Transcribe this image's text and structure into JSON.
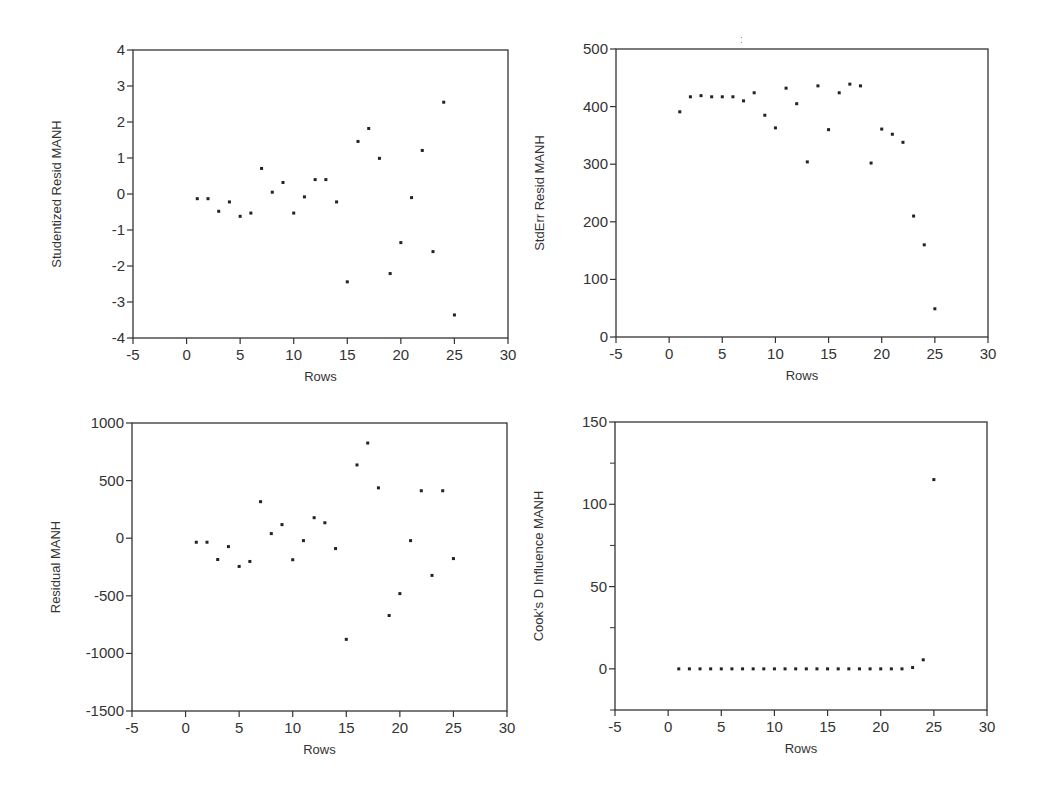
{
  "chart_data": [
    {
      "type": "scatter",
      "title": "",
      "xlabel": "Rows",
      "ylabel": "Studentized Resid MANH",
      "xlim": [
        -5,
        30
      ],
      "ylim": [
        -4,
        4
      ],
      "xticks": [
        -5,
        0,
        5,
        10,
        15,
        20,
        25,
        30
      ],
      "yticks": [
        -4,
        -3,
        -2,
        -1,
        0,
        1,
        2,
        3,
        4
      ],
      "ytick_labels": [
        "-4",
        "-3",
        "-2",
        "-1",
        "0",
        "1",
        "2",
        "3",
        "4"
      ],
      "minor_yticks": [],
      "grid": false,
      "x": [
        1,
        2,
        3,
        4,
        5,
        6,
        7,
        8,
        9,
        10,
        11,
        12,
        13,
        14,
        15,
        16,
        17,
        18,
        19,
        20,
        21,
        22,
        23,
        24,
        25
      ],
      "y": [
        -0.13,
        -0.13,
        -0.48,
        -0.22,
        -0.62,
        -0.53,
        0.71,
        0.05,
        0.32,
        -0.53,
        -0.08,
        0.4,
        0.4,
        -0.22,
        -2.44,
        1.46,
        1.82,
        0.99,
        -2.21,
        -1.35,
        -0.1,
        1.21,
        -1.6,
        2.55,
        -3.36
      ],
      "frame": {
        "left": 133,
        "top": 50,
        "right": 508,
        "bottom": 338
      }
    },
    {
      "type": "scatter",
      "title": "",
      "xlabel": "Rows",
      "ylabel": "StdErr Resid MANH",
      "xlim": [
        -5,
        30
      ],
      "ylim": [
        0,
        500
      ],
      "xticks": [
        -5,
        0,
        5,
        10,
        15,
        20,
        25,
        30
      ],
      "yticks": [
        0,
        100,
        200,
        300,
        400,
        500
      ],
      "ytick_labels": [
        "0",
        "100",
        "200",
        "300",
        "400",
        "500"
      ],
      "minor_yticks": [],
      "grid": false,
      "x": [
        1,
        2,
        3,
        4,
        5,
        6,
        7,
        8,
        9,
        10,
        11,
        12,
        13,
        14,
        15,
        16,
        17,
        18,
        19,
        20,
        21,
        22,
        23,
        24,
        25
      ],
      "y": [
        391,
        417,
        419,
        417,
        417,
        417,
        410,
        424,
        385,
        363,
        432,
        405,
        304,
        436,
        360,
        424,
        439,
        436,
        302,
        361,
        352,
        338,
        210,
        160,
        49
      ],
      "frame": {
        "left": 616,
        "top": 49,
        "right": 988,
        "bottom": 337
      }
    },
    {
      "type": "scatter",
      "title": "",
      "xlabel": "Rows",
      "ylabel": "Residual MANH",
      "xlim": [
        -5,
        30
      ],
      "ylim": [
        -1500,
        1000
      ],
      "xticks": [
        -5,
        0,
        5,
        10,
        15,
        20,
        25,
        30
      ],
      "yticks": [
        -1500,
        -1000,
        -500,
        0,
        500,
        1000
      ],
      "ytick_labels": [
        "-1500",
        "-1000",
        "-500",
        "0",
        "500",
        "1000"
      ],
      "minor_yticks": [],
      "grid": false,
      "x": [
        1,
        2,
        3,
        4,
        5,
        6,
        7,
        8,
        9,
        10,
        11,
        12,
        13,
        14,
        15,
        16,
        17,
        18,
        19,
        20,
        21,
        22,
        23,
        24,
        25
      ],
      "y": [
        -35,
        -35,
        -185,
        -73,
        -245,
        -202,
        317,
        40,
        118,
        -187,
        -21,
        178,
        134,
        -90,
        -878,
        636,
        826,
        437,
        -671,
        -481,
        -21,
        412,
        -323,
        412,
        -177
      ],
      "frame": {
        "left": 132,
        "top": 423,
        "right": 507,
        "bottom": 711
      }
    },
    {
      "type": "scatter",
      "title": "",
      "xlabel": "Rows",
      "ylabel": "Cook's D Influence MANH",
      "xlim": [
        -5,
        30
      ],
      "ylim": [
        -25,
        150
      ],
      "xticks": [
        -5,
        0,
        5,
        10,
        15,
        20,
        25,
        30
      ],
      "yticks": [
        0,
        50,
        100,
        150
      ],
      "ytick_labels": [
        "0",
        "50",
        "100",
        "150"
      ],
      "minor_yticks": [
        -25,
        25,
        75,
        125
      ],
      "grid": false,
      "x": [
        1,
        2,
        3,
        4,
        5,
        6,
        7,
        8,
        9,
        10,
        11,
        12,
        13,
        14,
        15,
        16,
        17,
        18,
        19,
        20,
        21,
        22,
        23,
        24,
        25
      ],
      "y": [
        0,
        0,
        0,
        0,
        0,
        0,
        0,
        0,
        0,
        0,
        0,
        0,
        0,
        0,
        0,
        0,
        0,
        0,
        0,
        0,
        0,
        0,
        0.8,
        5.5,
        115
      ],
      "frame": {
        "left": 615,
        "top": 422,
        "right": 987,
        "bottom": 710
      }
    }
  ]
}
